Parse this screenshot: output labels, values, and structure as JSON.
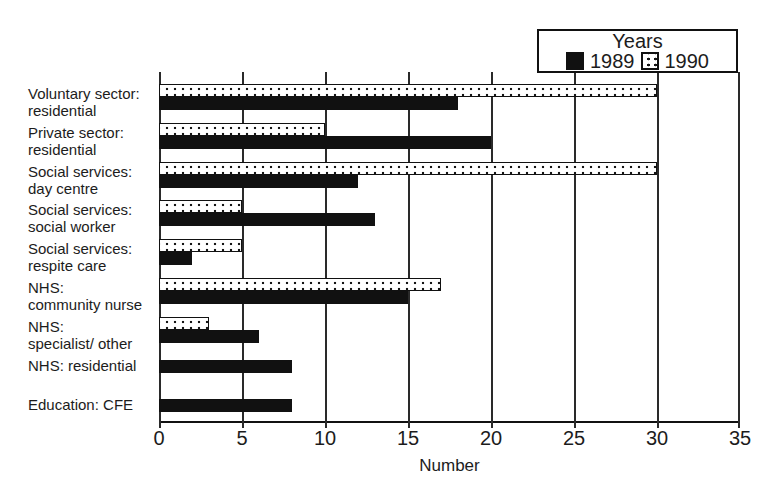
{
  "chart_data": {
    "type": "bar",
    "orientation": "horizontal",
    "title": "",
    "xlabel": "Number",
    "ylabel": "",
    "xlim": [
      0,
      35
    ],
    "xticks": [
      0,
      5,
      10,
      15,
      20,
      25,
      30,
      35
    ],
    "grid": "vertical-gridlines-on",
    "legend": {
      "title": "Years",
      "position": "top-right",
      "entries": [
        {
          "label": "1989",
          "swatch": "solid-black-square"
        },
        {
          "label": "1990",
          "swatch": "white-dotted-square"
        }
      ]
    },
    "categories": [
      "Voluntary sector: residential",
      "Private sector: residential",
      "Social services: day centre",
      "Social services: social worker",
      "Social services: respite care",
      "NHS: community nurse",
      "NHS: specialist/ other",
      "NHS: residential",
      "Education: CFE"
    ],
    "category_label_lines": [
      [
        "Voluntary sector:",
        "residential"
      ],
      [
        "Private sector:",
        "residential"
      ],
      [
        "Social services:",
        "day centre"
      ],
      [
        "Social services:",
        "social worker"
      ],
      [
        "Social services:",
        "respite care"
      ],
      [
        "NHS:",
        "community nurse"
      ],
      [
        "NHS:",
        "specialist/ other"
      ],
      [
        "NHS: residential"
      ],
      [
        "Education: CFE"
      ]
    ],
    "series": [
      {
        "name": "1989",
        "style": "solid-black",
        "values": [
          18,
          20,
          12,
          13,
          2,
          15,
          6,
          8,
          8
        ]
      },
      {
        "name": "1990",
        "style": "white-dotted",
        "values": [
          30,
          10,
          30,
          5,
          5,
          17,
          3,
          0,
          0
        ]
      }
    ],
    "bar_order_top_to_bottom": [
      "1990",
      "1989"
    ]
  },
  "colors": {
    "bar_1989": "#111111",
    "bar_1990_fill": "#ffffff",
    "bar_outline": "#111111",
    "axis": "#2a2a2a",
    "text": "#1c1c1c",
    "background": "#ffffff"
  }
}
